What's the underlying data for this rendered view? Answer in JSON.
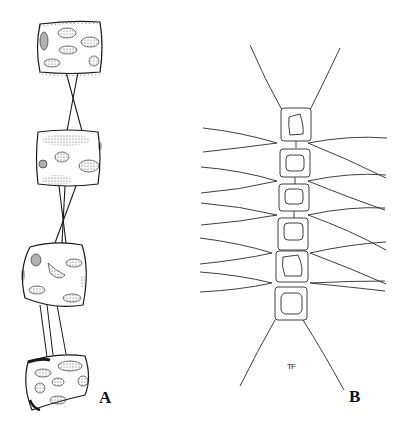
{
  "figure": {
    "panels": [
      {
        "id": "A",
        "label": "A",
        "description": "chain of four colonial cells connected by crossed/parallel threads"
      },
      {
        "id": "B",
        "label": "B",
        "description": "filament of six cells with long setae extending laterally"
      }
    ],
    "artist_mark": "TF"
  },
  "colors": {
    "ink": "#1a1a1a",
    "background": "#ffffff",
    "stipple": "#555555"
  }
}
